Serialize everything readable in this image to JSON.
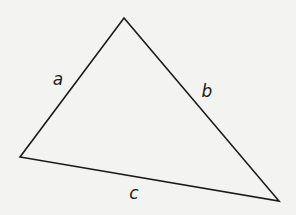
{
  "diagram": {
    "type": "triangle",
    "background": "#f3f3f2",
    "stroke_color": "#1a1a1a",
    "vertices": {
      "top": [
        124,
        18
      ],
      "left": [
        20,
        157
      ],
      "right": [
        279,
        201
      ]
    },
    "sides": [
      {
        "id": "a",
        "label": "a",
        "from": "left",
        "to": "top",
        "label_pos": [
          58,
          79
        ]
      },
      {
        "id": "b",
        "label": "b",
        "from": "top",
        "to": "right",
        "label_pos": [
          207,
          91
        ]
      },
      {
        "id": "c",
        "label": "c",
        "from": "left",
        "to": "right",
        "label_pos": [
          134,
          193
        ]
      }
    ]
  }
}
